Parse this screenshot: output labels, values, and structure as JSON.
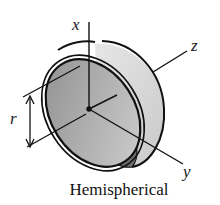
{
  "figure": {
    "caption": "Hemispherical",
    "axes": {
      "x": "x",
      "y": "y",
      "z": "z"
    },
    "dimension": {
      "label": "r"
    },
    "colors": {
      "ink": "#111111",
      "inner_shade": "#a9a9a9",
      "outer_shade": "#d8d8d8",
      "band": "#6e6e6e"
    }
  }
}
